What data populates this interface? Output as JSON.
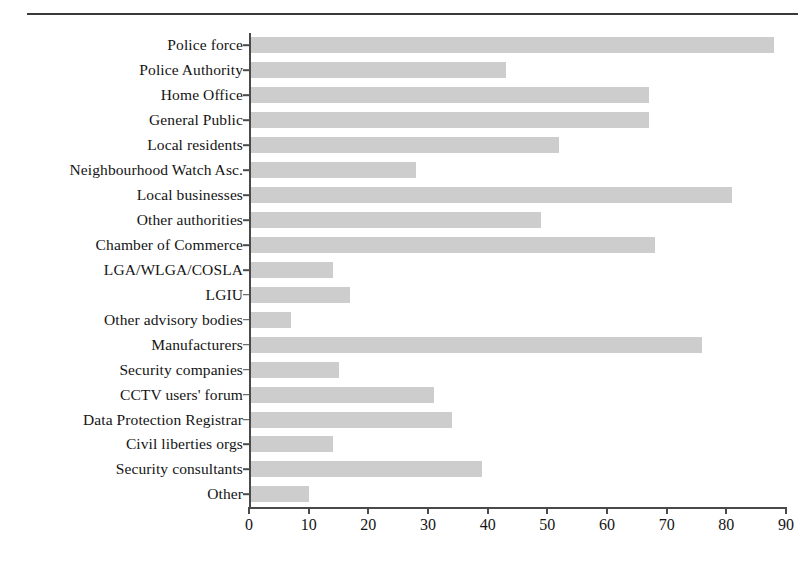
{
  "figure": {
    "top_rule": true,
    "background": "#ffffff",
    "bar_color": "#cdcdcd",
    "axis_color": "#4a4a4a",
    "text_color": "#141414"
  },
  "chart_data": {
    "type": "bar",
    "orientation": "horizontal",
    "title": "",
    "subtitle": "",
    "xlabel": "",
    "ylabel": "",
    "xlim": [
      0,
      90
    ],
    "xticks": [
      0,
      10,
      20,
      30,
      40,
      50,
      60,
      70,
      80,
      90
    ],
    "xtick_labels": [
      "0",
      "10",
      "20",
      "30",
      "40",
      "50",
      "60",
      "70",
      "80",
      "90"
    ],
    "grid": false,
    "legend": null,
    "categories": [
      "Police force",
      "Police Authority",
      "Home Office",
      "General Public",
      "Local residents",
      "Neighbourhood Watch Asc.",
      "Local businesses",
      "Other authorities",
      "Chamber of Commerce",
      "LGA/WLGA/COSLA",
      "LGIU",
      "Other advisory bodies",
      "Manufacturers",
      "Security companies",
      "CCTV users' forum",
      "Data Protection Registrar",
      "Civil liberties orgs",
      "Security consultants",
      "Other"
    ],
    "values": [
      88,
      43,
      67,
      67,
      52,
      28,
      81,
      49,
      68,
      14,
      17,
      7,
      76,
      15,
      31,
      34,
      14,
      39,
      10
    ]
  }
}
